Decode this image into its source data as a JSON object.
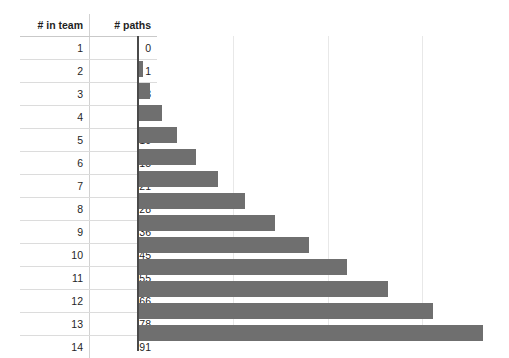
{
  "chart_data": {
    "type": "bar",
    "orientation": "horizontal",
    "title": "",
    "xlabel": "",
    "ylabel": "",
    "categories": [
      1,
      2,
      3,
      4,
      5,
      6,
      7,
      8,
      9,
      10,
      11,
      12,
      13,
      14
    ],
    "values": [
      0,
      1,
      3,
      6,
      10,
      15,
      21,
      28,
      36,
      45,
      55,
      66,
      78,
      91
    ],
    "series": [
      {
        "name": "# paths",
        "values": [
          0,
          1,
          3,
          6,
          10,
          15,
          21,
          28,
          36,
          45,
          55,
          66,
          78,
          91
        ]
      }
    ],
    "xlim": [
      0,
      98
    ],
    "ylim": null,
    "grid": true,
    "gridlines_x": [
      25,
      50,
      75
    ],
    "legend": false,
    "legend_position": "none",
    "bar_color": "#6f6f6f",
    "axis_color": "#4a4a4a",
    "gridline_color": "#e8e8e8"
  },
  "table": {
    "headers": {
      "team": "# in team",
      "paths": "# paths"
    },
    "rows": [
      {
        "team": "1",
        "paths": "0"
      },
      {
        "team": "2",
        "paths": "1"
      },
      {
        "team": "3",
        "paths": "3"
      },
      {
        "team": "4",
        "paths": "6"
      },
      {
        "team": "5",
        "paths": "10"
      },
      {
        "team": "6",
        "paths": "15"
      },
      {
        "team": "7",
        "paths": "21"
      },
      {
        "team": "8",
        "paths": "28"
      },
      {
        "team": "9",
        "paths": "36"
      },
      {
        "team": "10",
        "paths": "45"
      },
      {
        "team": "11",
        "paths": "55"
      },
      {
        "team": "12",
        "paths": "66"
      },
      {
        "team": "13",
        "paths": "78"
      },
      {
        "team": "14",
        "paths": "91"
      }
    ]
  }
}
